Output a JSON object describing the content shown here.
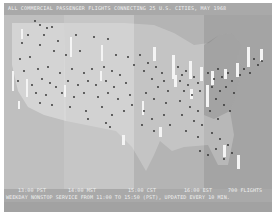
{
  "title": "ALL COMMERCIAL PASSENGER FLIGHTS CONNECTING 25 U.S. CITIES, MAY 1968",
  "time_zones": [
    {
      "label": "13:00 PST",
      "color": "#bfbfbf"
    },
    {
      "label": "14:00 MST",
      "color": "#c6c6c6"
    },
    {
      "label": "15:00 CST",
      "color": "#b4b4b4"
    },
    {
      "label": "16:00 EST",
      "color": "#a4a4a4"
    }
  ],
  "flight_count": "700 FLIGHTS",
  "service_text": "WEEKDAY NONSTOP SERVICE FROM 11:00 TO 15:50 (PST), UPDATED EVERY 10 MIN.",
  "colors": {
    "screen_bg": "#a9a9a9",
    "land": "#d2d2d2",
    "plane_dot": "#2a2a2a",
    "city_bar": "#f4f4f4"
  }
}
